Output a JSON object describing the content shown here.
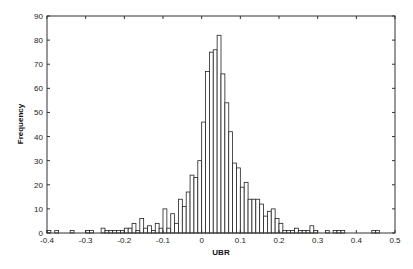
{
  "chart_data": {
    "type": "bar",
    "subtype": "histogram",
    "title": "",
    "xlabel": "UBR",
    "ylabel": "Frequency",
    "xlim": [
      -0.4,
      0.5
    ],
    "ylim": [
      0,
      90
    ],
    "grid": false,
    "legend": null,
    "bin_width": 0.01,
    "xticks": [
      -0.4,
      -0.3,
      -0.2,
      -0.1,
      0,
      0.1,
      0.2,
      0.3,
      0.4,
      0.5
    ],
    "xtick_labels": [
      "-0.4",
      "-0.3",
      "-0.2",
      "-0.1",
      "0",
      "0.1",
      "0.2",
      "0.3",
      "0.4",
      "0.5"
    ],
    "yticks": [
      0,
      10,
      20,
      30,
      40,
      50,
      60,
      70,
      80,
      90
    ],
    "ytick_labels": [
      "0",
      "10",
      "20",
      "30",
      "40",
      "50",
      "60",
      "70",
      "80",
      "90"
    ],
    "bins": [
      {
        "x": -0.4,
        "count": 1
      },
      {
        "x": -0.38,
        "count": 1
      },
      {
        "x": -0.34,
        "count": 1
      },
      {
        "x": -0.3,
        "count": 1
      },
      {
        "x": -0.29,
        "count": 1
      },
      {
        "x": -0.26,
        "count": 2
      },
      {
        "x": -0.25,
        "count": 1
      },
      {
        "x": -0.24,
        "count": 1
      },
      {
        "x": -0.23,
        "count": 1
      },
      {
        "x": -0.22,
        "count": 1
      },
      {
        "x": -0.21,
        "count": 1
      },
      {
        "x": -0.2,
        "count": 2
      },
      {
        "x": -0.19,
        "count": 2
      },
      {
        "x": -0.18,
        "count": 4
      },
      {
        "x": -0.17,
        "count": 1
      },
      {
        "x": -0.16,
        "count": 6
      },
      {
        "x": -0.15,
        "count": 2
      },
      {
        "x": -0.14,
        "count": 3
      },
      {
        "x": -0.13,
        "count": 1
      },
      {
        "x": -0.12,
        "count": 4
      },
      {
        "x": -0.11,
        "count": 2
      },
      {
        "x": -0.1,
        "count": 10
      },
      {
        "x": -0.09,
        "count": 2
      },
      {
        "x": -0.08,
        "count": 8
      },
      {
        "x": -0.07,
        "count": 4
      },
      {
        "x": -0.06,
        "count": 14
      },
      {
        "x": -0.05,
        "count": 11
      },
      {
        "x": -0.04,
        "count": 17
      },
      {
        "x": -0.03,
        "count": 24
      },
      {
        "x": -0.02,
        "count": 23
      },
      {
        "x": -0.01,
        "count": 30
      },
      {
        "x": 0.0,
        "count": 46
      },
      {
        "x": 0.01,
        "count": 67
      },
      {
        "x": 0.02,
        "count": 75
      },
      {
        "x": 0.03,
        "count": 76
      },
      {
        "x": 0.04,
        "count": 82
      },
      {
        "x": 0.05,
        "count": 66
      },
      {
        "x": 0.06,
        "count": 54
      },
      {
        "x": 0.07,
        "count": 42
      },
      {
        "x": 0.08,
        "count": 29
      },
      {
        "x": 0.09,
        "count": 27
      },
      {
        "x": 0.1,
        "count": 19
      },
      {
        "x": 0.11,
        "count": 21
      },
      {
        "x": 0.12,
        "count": 14
      },
      {
        "x": 0.13,
        "count": 14
      },
      {
        "x": 0.14,
        "count": 14
      },
      {
        "x": 0.15,
        "count": 12
      },
      {
        "x": 0.16,
        "count": 7
      },
      {
        "x": 0.17,
        "count": 9
      },
      {
        "x": 0.18,
        "count": 10
      },
      {
        "x": 0.19,
        "count": 6
      },
      {
        "x": 0.2,
        "count": 4
      },
      {
        "x": 0.21,
        "count": 1
      },
      {
        "x": 0.22,
        "count": 1
      },
      {
        "x": 0.23,
        "count": 1
      },
      {
        "x": 0.24,
        "count": 2
      },
      {
        "x": 0.25,
        "count": 1
      },
      {
        "x": 0.26,
        "count": 1
      },
      {
        "x": 0.27,
        "count": 1
      },
      {
        "x": 0.28,
        "count": 3
      },
      {
        "x": 0.29,
        "count": 1
      },
      {
        "x": 0.32,
        "count": 1
      },
      {
        "x": 0.34,
        "count": 1
      },
      {
        "x": 0.35,
        "count": 1
      },
      {
        "x": 0.36,
        "count": 1
      },
      {
        "x": 0.44,
        "count": 1
      },
      {
        "x": 0.45,
        "count": 1
      }
    ]
  },
  "style": {
    "bar_fill": "#ffffff",
    "bar_stroke": "#222222",
    "axis_color": "#333333"
  }
}
